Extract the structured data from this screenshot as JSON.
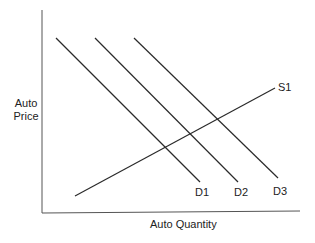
{
  "chart_data": {
    "type": "line",
    "title": "",
    "xlabel": "Auto Quantity",
    "ylabel": "Auto Price",
    "ylabel_lines": [
      "Auto",
      "Price"
    ],
    "grid": false,
    "ticks": "none",
    "series": [
      {
        "name": "D1",
        "kind": "demand",
        "points": [
          [
            56,
            38
          ],
          [
            200,
            182
          ]
        ]
      },
      {
        "name": "D2",
        "kind": "demand",
        "points": [
          [
            95,
            38
          ],
          [
            238,
            182
          ]
        ]
      },
      {
        "name": "D3",
        "kind": "demand",
        "points": [
          [
            134,
            38
          ],
          [
            278,
            178
          ]
        ]
      },
      {
        "name": "S1",
        "kind": "supply",
        "points": [
          [
            75,
            196
          ],
          [
            275,
            88
          ]
        ]
      }
    ],
    "labels": {
      "D1": "D1",
      "D2": "D2",
      "D3": "D3",
      "S1": "S1"
    }
  },
  "colors": {
    "line": "#2a2a2a",
    "axis": "#555555",
    "text": "#222222"
  }
}
